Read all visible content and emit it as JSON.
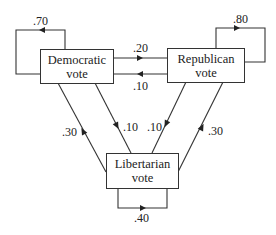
{
  "diagram": {
    "type": "state-transition",
    "nodes": [
      {
        "id": "democratic",
        "line1": "Democratic",
        "line2": "vote"
      },
      {
        "id": "republican",
        "line1": "Republican",
        "line2": "vote"
      },
      {
        "id": "libertarian",
        "line1": "Libertarian",
        "line2": "vote"
      }
    ],
    "edges": [
      {
        "from": "democratic",
        "to": "democratic",
        "label": ".70"
      },
      {
        "from": "republican",
        "to": "republican",
        "label": ".80"
      },
      {
        "from": "libertarian",
        "to": "libertarian",
        "label": ".40"
      },
      {
        "from": "democratic",
        "to": "republican",
        "label": ".20"
      },
      {
        "from": "republican",
        "to": "democratic",
        "label": ".10"
      },
      {
        "from": "libertarian",
        "to": "democratic",
        "label": ".30"
      },
      {
        "from": "democratic",
        "to": "libertarian",
        "label": ".10"
      },
      {
        "from": "republican",
        "to": "libertarian",
        "label": ".10"
      },
      {
        "from": "libertarian",
        "to": "republican",
        "label": ".30"
      }
    ],
    "line_color": "#333333"
  }
}
